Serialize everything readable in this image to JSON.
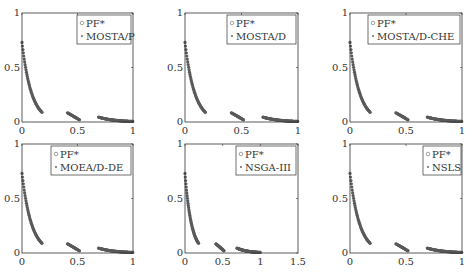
{
  "figure": {
    "layout": "2x3 grid of scatter plots"
  },
  "chart_data": [
    {
      "type": "scatter",
      "title": "",
      "xlabel": "",
      "ylabel": "",
      "xlim": [
        0,
        1
      ],
      "ylim": [
        0,
        1
      ],
      "xticks": [
        "0",
        "0.5",
        "1"
      ],
      "yticks": [
        "0",
        "0.5",
        "1"
      ],
      "legend": [
        "PF*",
        "MOSTA/P"
      ],
      "legend_position": "upper right",
      "series": [
        {
          "name": "PF*",
          "marker": "circle",
          "segments": [
            [
              [
                0,
                0.73
              ],
              [
                0.05,
                0.42
              ],
              [
                0.1,
                0.24
              ],
              [
                0.15,
                0.13
              ],
              [
                0.18,
                0.09
              ]
            ],
            [
              [
                0.41,
                0.08
              ],
              [
                0.45,
                0.06
              ],
              [
                0.5,
                0.03
              ],
              [
                0.52,
                0.02
              ]
            ],
            [
              [
                0.69,
                0.04
              ],
              [
                0.8,
                0.02
              ],
              [
                0.9,
                0.01
              ],
              [
                1,
                0.0
              ]
            ]
          ]
        },
        {
          "name": "MOSTA/P",
          "marker": "dot",
          "segments": [
            [
              [
                0,
                0.73
              ],
              [
                0.05,
                0.42
              ],
              [
                0.1,
                0.24
              ],
              [
                0.15,
                0.13
              ],
              [
                0.18,
                0.09
              ]
            ],
            [
              [
                0.41,
                0.08
              ],
              [
                0.45,
                0.06
              ],
              [
                0.5,
                0.03
              ],
              [
                0.52,
                0.02
              ]
            ],
            [
              [
                0.69,
                0.04
              ],
              [
                0.8,
                0.02
              ],
              [
                0.9,
                0.01
              ],
              [
                1,
                0.0
              ]
            ]
          ]
        }
      ]
    },
    {
      "type": "scatter",
      "xlim": [
        0,
        1
      ],
      "ylim": [
        0,
        1
      ],
      "xticks": [
        "0",
        "0.5",
        "1"
      ],
      "yticks": [
        "0",
        "0.5",
        "1"
      ],
      "legend": [
        "PF*",
        "MOSTA/D"
      ],
      "legend_position": "upper right",
      "series": [
        {
          "name": "PF*",
          "marker": "circle"
        },
        {
          "name": "MOSTA/D",
          "marker": "dot"
        }
      ]
    },
    {
      "type": "scatter",
      "xlim": [
        0,
        1
      ],
      "ylim": [
        0,
        1
      ],
      "xticks": [
        "0",
        "0.5",
        "1"
      ],
      "yticks": [
        "0",
        "0.5",
        "1"
      ],
      "legend": [
        "PF*",
        "MOSTA/D-CHE"
      ],
      "legend_position": "upper right",
      "series": [
        {
          "name": "PF*",
          "marker": "circle"
        },
        {
          "name": "MOSTA/D-CHE",
          "marker": "dot"
        }
      ]
    },
    {
      "type": "scatter",
      "xlim": [
        0,
        1
      ],
      "ylim": [
        0,
        1
      ],
      "xticks": [
        "0",
        "0.5",
        "1"
      ],
      "yticks": [
        "0",
        "0.5",
        "1"
      ],
      "legend": [
        "PF*",
        "MOEA/D-DE"
      ],
      "legend_position": "upper right",
      "series": [
        {
          "name": "PF*",
          "marker": "circle"
        },
        {
          "name": "MOEA/D-DE",
          "marker": "dot"
        }
      ]
    },
    {
      "type": "scatter",
      "xlim": [
        0,
        1.5
      ],
      "ylim": [
        0,
        1
      ],
      "xticks": [
        "0",
        "0.5",
        "1",
        "1.5"
      ],
      "yticks": [
        "0",
        "0.5",
        "1"
      ],
      "legend": [
        "PF*",
        "NSGA-III"
      ],
      "legend_position": "upper right",
      "series": [
        {
          "name": "PF*",
          "marker": "circle"
        },
        {
          "name": "NSGA-III",
          "marker": "dot"
        }
      ]
    },
    {
      "type": "scatter",
      "xlim": [
        0,
        1
      ],
      "ylim": [
        0,
        1
      ],
      "xticks": [
        "0",
        "0.5",
        "1"
      ],
      "yticks": [
        "0",
        "0.5",
        "1"
      ],
      "legend": [
        "PF*",
        "NSLS"
      ],
      "legend_position": "upper right",
      "series": [
        {
          "name": "PF*",
          "marker": "circle"
        },
        {
          "name": "NSLS",
          "marker": "dot"
        }
      ]
    }
  ],
  "panels": [
    {
      "legend": {
        "pf": "PF*",
        "algo": "MOSTA/P"
      },
      "xticks": [
        "0",
        "0.5",
        "1"
      ],
      "yticks": [
        "0",
        "0.5",
        "1"
      ]
    },
    {
      "legend": {
        "pf": "PF*",
        "algo": "MOSTA/D"
      },
      "xticks": [
        "0",
        "0.5",
        "1"
      ],
      "yticks": [
        "0",
        "0.5",
        "1"
      ]
    },
    {
      "legend": {
        "pf": "PF*",
        "algo": "MOSTA/D-CHE"
      },
      "xticks": [
        "0",
        "0.5",
        "1"
      ],
      "yticks": [
        "0",
        "0.5",
        "1"
      ]
    },
    {
      "legend": {
        "pf": "PF*",
        "algo": "MOEA/D-DE"
      },
      "xticks": [
        "0",
        "0.5",
        "1"
      ],
      "yticks": [
        "0",
        "0.5",
        "1"
      ]
    },
    {
      "legend": {
        "pf": "PF*",
        "algo": "NSGA-III"
      },
      "xticks": [
        "0",
        "0.5",
        "1",
        "1.5"
      ],
      "yticks": [
        "0",
        "0.5",
        "1"
      ]
    },
    {
      "legend": {
        "pf": "PF*",
        "algo": "NSLS"
      },
      "xticks": [
        "0",
        "0.5",
        "1"
      ],
      "yticks": [
        "0",
        "0.5",
        "1"
      ]
    }
  ],
  "colors": {
    "axis": "#333333",
    "points": "#555555",
    "legend_border": "#333333"
  }
}
